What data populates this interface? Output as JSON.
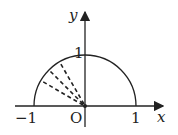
{
  "diagram": {
    "type": "unit semicircle with dashed radii",
    "axes": {
      "x_label": "x",
      "y_label": "y",
      "origin_label": "O",
      "ticks": {
        "x_neg": "−1",
        "x_pos": "1",
        "y_pos": "1"
      }
    },
    "semicircle": {
      "radius": 1,
      "range_deg": [
        0,
        180
      ]
    },
    "dashed_radii_deg": [
      120,
      135,
      150
    ],
    "colors": {
      "stroke": "#222222",
      "background": "#ffffff"
    }
  }
}
